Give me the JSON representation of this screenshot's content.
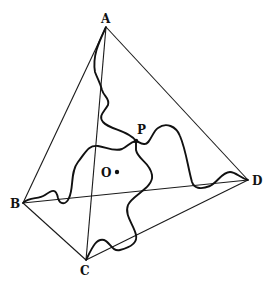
{
  "diagram": {
    "type": "tetrahedron-with-curves",
    "vertices": [
      {
        "label": "A",
        "x": 106,
        "y": 27
      },
      {
        "label": "B",
        "x": 23,
        "y": 203
      },
      {
        "label": "C",
        "x": 86,
        "y": 260
      },
      {
        "label": "D",
        "x": 248,
        "y": 180
      }
    ],
    "edges": [
      [
        "A",
        "B"
      ],
      [
        "A",
        "C"
      ],
      [
        "A",
        "D"
      ],
      [
        "B",
        "C"
      ],
      [
        "B",
        "D"
      ],
      [
        "C",
        "D"
      ]
    ],
    "interior_point": {
      "label": "P",
      "x": 136,
      "y": 141
    },
    "center_point": {
      "label": "O",
      "x": 117,
      "y": 172
    },
    "curves": [
      "A-P",
      "B-P",
      "C-P",
      "D-P"
    ],
    "colors": {
      "line": "#1a1a1a",
      "background": "#ffffff"
    }
  }
}
